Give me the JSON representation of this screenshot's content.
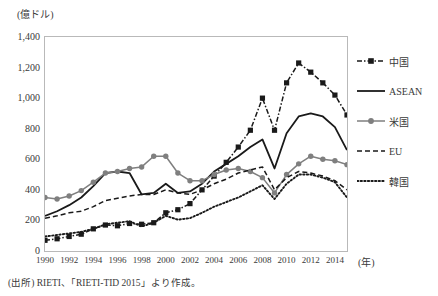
{
  "figure": {
    "y_axis_unit": "(億ドル)",
    "x_axis_unit": "(年)",
    "source_note": "(出所) RIETI、「RIETI-TID 2015」より作成。"
  },
  "legend": {
    "position": "right",
    "items": [
      {
        "label": "中国",
        "style": "dash-dot-marker-square",
        "color": "#1a1a1a"
      },
      {
        "label": "ASEAN",
        "style": "solid",
        "color": "#1a1a1a"
      },
      {
        "label": "米国",
        "style": "solid-marker-circle",
        "color": "#7f7f7f"
      },
      {
        "label": "EU",
        "style": "dashed",
        "color": "#1a1a1a"
      },
      {
        "label": "韓国",
        "style": "dotted",
        "color": "#1a1a1a"
      }
    ]
  },
  "chart_data": {
    "type": "line",
    "title": "",
    "xlabel": "(年)",
    "ylabel": "(億ドル)",
    "xlim": [
      1990,
      2015
    ],
    "ylim": [
      0,
      1400
    ],
    "ytick_labels": [
      "1,400",
      "1,200",
      "1,000",
      "800",
      "600",
      "400",
      "200",
      "0"
    ],
    "ytick_values": [
      1400,
      1200,
      1000,
      800,
      600,
      400,
      200,
      0
    ],
    "xtick_labels": [
      "1990",
      "1992",
      "1994",
      "1996",
      "1998",
      "2000",
      "2002",
      "2004",
      "2006",
      "2008",
      "2010",
      "2012",
      "2014"
    ],
    "xtick_values": [
      1990,
      1992,
      1994,
      1996,
      1998,
      2000,
      2002,
      2004,
      2006,
      2008,
      2010,
      2012,
      2014
    ],
    "grid": false,
    "legend_position": "right",
    "x": [
      1990,
      1991,
      1992,
      1993,
      1994,
      1995,
      1996,
      1997,
      1998,
      1999,
      2000,
      2001,
      2002,
      2003,
      2004,
      2005,
      2006,
      2007,
      2008,
      2009,
      2010,
      2011,
      2012,
      2013,
      2014,
      2015
    ],
    "series": [
      {
        "name": "中国",
        "color": "#1a1a1a",
        "style": "dash-dot-marker-square",
        "values": [
          70,
          80,
          95,
          110,
          145,
          170,
          165,
          180,
          175,
          185,
          250,
          270,
          310,
          400,
          490,
          580,
          680,
          790,
          1000,
          790,
          1100,
          1230,
          1170,
          1100,
          1020,
          890
        ]
      },
      {
        "name": "ASEAN",
        "color": "#1a1a1a",
        "style": "solid",
        "values": [
          230,
          260,
          300,
          350,
          425,
          510,
          520,
          510,
          370,
          380,
          440,
          380,
          390,
          440,
          520,
          570,
          620,
          680,
          730,
          540,
          770,
          880,
          900,
          880,
          810,
          660
        ]
      },
      {
        "name": "米国",
        "color": "#7f7f7f",
        "style": "solid-marker-circle",
        "values": [
          350,
          340,
          360,
          395,
          450,
          510,
          520,
          540,
          550,
          620,
          620,
          510,
          460,
          460,
          500,
          530,
          540,
          520,
          480,
          380,
          500,
          570,
          620,
          600,
          590,
          565
        ]
      },
      {
        "name": "EU",
        "color": "#1a1a1a",
        "style": "dashed",
        "values": [
          215,
          230,
          250,
          260,
          290,
          330,
          345,
          360,
          370,
          370,
          400,
          380,
          370,
          400,
          440,
          470,
          510,
          530,
          550,
          400,
          480,
          520,
          510,
          490,
          460,
          400
        ]
      },
      {
        "name": "韓国",
        "color": "#1a1a1a",
        "style": "dotted",
        "values": [
          95,
          105,
          115,
          125,
          145,
          175,
          185,
          195,
          160,
          185,
          230,
          205,
          215,
          250,
          290,
          320,
          350,
          390,
          430,
          340,
          440,
          500,
          500,
          480,
          450,
          350
        ]
      }
    ]
  }
}
